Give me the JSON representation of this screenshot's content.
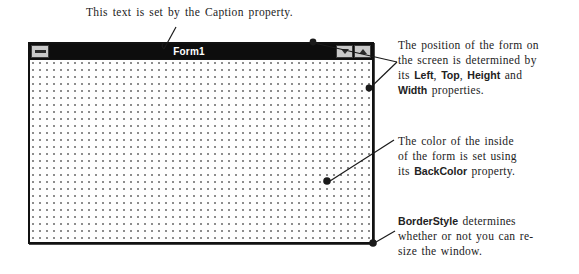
{
  "figure": {
    "caption_note": "This text is set by the  Caption property.",
    "form": {
      "title": "Form1",
      "sys_menu_icon": "control-menu-box-icon",
      "minimize_icon": "minimize-triangle-icon",
      "maximize_icon": "maximize-triangle-icon",
      "client_background": "#fefefe",
      "title_bar_color": "#0d0d0d",
      "title_text_color": "#ffffff",
      "border_color": "#111111",
      "grid_dot_color": "#8a8a8a"
    },
    "notes": {
      "position": {
        "line1": "The position of the form on",
        "line2": "the screen is determined by",
        "line3_prefix": "its ",
        "prop_left": "Left",
        "sep1": ",  ",
        "prop_top": "Top",
        "sep2": ",  ",
        "prop_height": "Height",
        "line3_suffix": " and",
        "prop_width": "Width",
        "line4_suffix": " properties."
      },
      "backcolor": {
        "line1": "The color of the inside",
        "line2": "of the form is set using",
        "line3_prefix": "its  ",
        "prop_backcolor": "BackColor",
        "line3_suffix": " property."
      },
      "borderstyle": {
        "prop_borderstyle": "BorderStyle",
        "line1_suffix": " determines",
        "line2": "whether or not you can re-",
        "line3": "size the window."
      }
    }
  }
}
